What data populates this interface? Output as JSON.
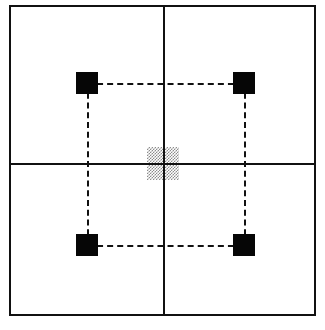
{
  "figure": {
    "background_color": "#ffffff",
    "line_color": "#111111",
    "marker_color": "#060606",
    "hatch_color": "#8c8c8c"
  },
  "frame": {
    "label": "outer-boundary-rectangle",
    "x": 9,
    "y": 5,
    "width": 307,
    "height": 311,
    "stroke_width": 2,
    "stroke_color": "#111111"
  },
  "axes": {
    "vertical": {
      "label": "vertical-axis",
      "x": 163,
      "y_start": 5,
      "y_end": 316,
      "thickness": 2
    },
    "horizontal": {
      "label": "horizontal-axis",
      "y": 163,
      "x_start": 9,
      "x_end": 316,
      "thickness": 2
    }
  },
  "markers": [
    {
      "name": "top-left-marker",
      "quadrant": "upper-left",
      "x": 76,
      "y": 72,
      "size": 22,
      "fill": "#060606"
    },
    {
      "name": "top-right-marker",
      "quadrant": "upper-right",
      "x": 233,
      "y": 72,
      "size": 22,
      "fill": "#060606"
    },
    {
      "name": "bottom-left-marker",
      "quadrant": "lower-left",
      "x": 76,
      "y": 234,
      "size": 22,
      "fill": "#060606"
    },
    {
      "name": "bottom-right-marker",
      "quadrant": "lower-right",
      "x": 233,
      "y": 234,
      "size": 22,
      "fill": "#060606"
    }
  ],
  "connectors": [
    {
      "name": "top-connector",
      "orientation": "horizontal",
      "x_start": 87,
      "x_end": 244,
      "y": 83,
      "style": "dashed",
      "dash": "6px dash / 3px gap",
      "thickness": 2
    },
    {
      "name": "bottom-connector",
      "orientation": "horizontal",
      "x_start": 87,
      "x_end": 244,
      "y": 245,
      "style": "dashed",
      "dash": "6px dash / 3px gap",
      "thickness": 2
    },
    {
      "name": "left-connector",
      "orientation": "vertical",
      "y_start": 83,
      "y_end": 245,
      "x": 87,
      "style": "dashed",
      "dash": "5px dash / 3px gap",
      "thickness": 2
    },
    {
      "name": "right-connector",
      "orientation": "vertical",
      "y_start": 83,
      "y_end": 245,
      "x": 244,
      "style": "dashed",
      "dash": "5px dash / 3px gap",
      "thickness": 2
    }
  ],
  "center_target": {
    "name": "center-hatched-square",
    "x": 147,
    "y": 147,
    "width": 32,
    "height": 33,
    "pattern": "crosshatch",
    "pattern_color": "#8c8c8c"
  }
}
